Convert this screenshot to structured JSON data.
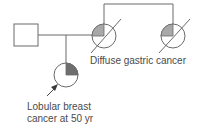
{
  "diagram": {
    "type": "pedigree",
    "colors": {
      "line": "#6a6a6a",
      "affected_gastric_fill": "#a8a8a8",
      "affected_breast_fill": "#6e6e6e",
      "background": "#ffffff",
      "text": "#4a4a4a"
    },
    "individuals": [
      {
        "id": "father",
        "shape": "square",
        "sex": "male",
        "affected": false,
        "deceased": false
      },
      {
        "id": "mother",
        "shape": "circle",
        "sex": "female",
        "affected": true,
        "condition": "Diffuse gastric cancer",
        "shaded_quadrant": "top-left",
        "deceased": true
      },
      {
        "id": "maternal-sister",
        "shape": "circle",
        "sex": "female",
        "affected": true,
        "condition": "Diffuse gastric cancer",
        "shaded_quadrant": "top-left",
        "deceased": true
      },
      {
        "id": "proband",
        "shape": "circle",
        "sex": "female",
        "affected": true,
        "condition": "Lobular breast cancer at 50 yr",
        "shaded_quadrant": "top-right",
        "deceased": false,
        "proband_arrow": true
      }
    ],
    "labels": {
      "gastric": "Diffuse gastric cancer",
      "breast_line1": "Lobular breast",
      "breast_line2": "cancer at 50 yr"
    }
  }
}
